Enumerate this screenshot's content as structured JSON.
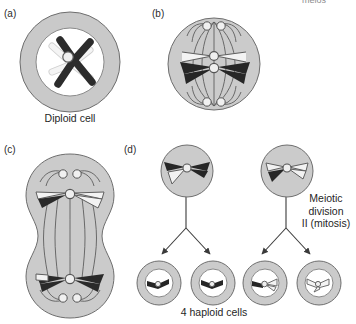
{
  "figure": {
    "type": "biology-diagram",
    "cropped_header_text": "meios"
  },
  "panels": [
    {
      "id": "a",
      "letter": "(a)",
      "caption": "Diploid cell",
      "stage": "Prophase I — bivalent with chiasma (crossing over)",
      "cell_shape": "round-with-nucleus",
      "chromosomes": [
        "dark",
        "light"
      ]
    },
    {
      "id": "b",
      "letter": "(b)",
      "caption": "",
      "stage": "Metaphase I — chromosomes aligned on equator, spindle formed",
      "cell_shape": "round-spindle",
      "chromosomes": [
        "light",
        "dark"
      ]
    },
    {
      "id": "c",
      "letter": "(c)",
      "caption": "",
      "stage": "Anaphase I / Telophase I — cell elongating and cleaving",
      "cell_shape": "dumbbell",
      "chromosomes": [
        "light-with-dark-arm",
        "dark-with-light-arm"
      ]
    },
    {
      "id": "d",
      "letter": "(d)",
      "caption": "4 haploid cells",
      "side_label_lines": [
        "Meiotic",
        "division",
        "II (mitosis)"
      ],
      "stage": "Meiotic division II producing four haploid cells",
      "parent_cells": [
        {
          "name": "daughter-cell-left",
          "fill": "dark-with-light-arm"
        },
        {
          "name": "daughter-cell-right",
          "fill": "light-with-dark-arm"
        }
      ],
      "haploid_cells": [
        {
          "index": 1,
          "chromatid": "dark"
        },
        {
          "index": 2,
          "chromatid": "dark"
        },
        {
          "index": 3,
          "chromatid": "recombinant"
        },
        {
          "index": 4,
          "chromatid": "light"
        }
      ]
    }
  ],
  "colors": {
    "background": "#ffffff",
    "cytoplasm": "#c9c9c9",
    "cytoplasm_light": "#d2d2d2",
    "nucleus": "#ffffff",
    "chromosome_dark": "#2a2a2a",
    "chromosome_light": "#f2f2f2",
    "outline": "#4a4a4a",
    "text": "#1f1f1f",
    "arrow": "#3a3a3a"
  }
}
